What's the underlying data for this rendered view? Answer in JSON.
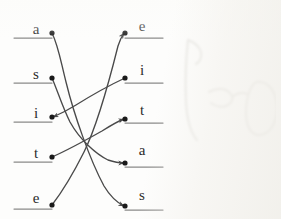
{
  "document": {
    "kind": "hand-drawn-matching-diagram",
    "title": "Letter matching exercise",
    "description": "Two columns of lowercase letters written on ruled answer lines, joined by hand-drawn pencil matching strokes.",
    "ink_color": "#4a4a4a",
    "rule_color": "#8a8a8a",
    "dot_color": "#1a1a1a",
    "paper_color": "#fdfdfc",
    "smudge_color": "#cfcdc7"
  },
  "columns": {
    "left": {
      "name": "left-column",
      "align": "rule-left-of-dot",
      "items": [
        {
          "id": "L1",
          "label": "a",
          "label_x": 36,
          "label_y": 34,
          "dot_x": 52,
          "dot_y": 33,
          "rule_x1": 14,
          "rule_x2": 52,
          "rule_y": 38
        },
        {
          "id": "L2",
          "label": "s",
          "label_x": 36,
          "label_y": 79,
          "dot_x": 52,
          "dot_y": 78,
          "rule_x1": 14,
          "rule_x2": 52,
          "rule_y": 83
        },
        {
          "id": "L3",
          "label": "i",
          "label_x": 36,
          "label_y": 118,
          "dot_x": 52,
          "dot_y": 117,
          "rule_x1": 14,
          "rule_x2": 52,
          "rule_y": 122
        },
        {
          "id": "L4",
          "label": "t",
          "label_x": 36,
          "label_y": 158,
          "dot_x": 52,
          "dot_y": 157,
          "rule_x1": 14,
          "rule_x2": 52,
          "rule_y": 162
        },
        {
          "id": "L5",
          "label": "e",
          "label_x": 36,
          "label_y": 203,
          "dot_x": 52,
          "dot_y": 205,
          "rule_x1": 14,
          "rule_x2": 52,
          "rule_y": 209
        }
      ]
    },
    "right": {
      "name": "right-column",
      "align": "rule-right-of-dot",
      "items": [
        {
          "id": "R1",
          "label": "e",
          "label_x": 142,
          "label_y": 31,
          "dot_x": 125,
          "dot_y": 33,
          "rule_x1": 125,
          "rule_x2": 163,
          "rule_y": 38
        },
        {
          "id": "R2",
          "label": "i",
          "label_x": 142,
          "label_y": 75,
          "dot_x": 125,
          "dot_y": 78,
          "rule_x1": 125,
          "rule_x2": 163,
          "rule_y": 83
        },
        {
          "id": "R3",
          "label": "t",
          "label_x": 142,
          "label_y": 115,
          "dot_x": 125,
          "dot_y": 119,
          "rule_x1": 125,
          "rule_x2": 163,
          "rule_y": 123
        },
        {
          "id": "R4",
          "label": "a",
          "label_x": 142,
          "label_y": 155,
          "dot_x": 125,
          "dot_y": 163,
          "rule_x1": 125,
          "rule_x2": 163,
          "rule_y": 167
        },
        {
          "id": "R5",
          "label": "s",
          "label_x": 142,
          "label_y": 200,
          "dot_x": 125,
          "dot_y": 206,
          "rule_x1": 125,
          "rule_x2": 163,
          "rule_y": 210
        }
      ]
    }
  },
  "connections": [
    {
      "id": "C1",
      "from": "L1",
      "from_label": "a",
      "to": "R5",
      "to_label": "s",
      "arrow_at": "to",
      "path": "M52,33 C58,45 60,58 66,82 C74,115 90,160 104,186 C110,196 118,203 124,206"
    },
    {
      "id": "C2",
      "from": "L2",
      "from_label": "s",
      "to": "R4",
      "to_label": "a",
      "arrow_at": "to",
      "path": "M52,78 C58,92 62,106 70,122 C80,140 96,154 108,160 C114,162 120,163 124,163"
    },
    {
      "id": "C3",
      "from": "R2",
      "from_label": "i",
      "to": "L3",
      "to_label": "i",
      "arrow_at": "to",
      "path": "M125,78 C110,85 92,95 76,105 C68,110 60,114 53,117"
    },
    {
      "id": "C4",
      "from": "L4",
      "from_label": "t",
      "to": "R3",
      "to_label": "t",
      "arrow_at": "to",
      "path": "M52,157 C68,150 86,140 102,131 C110,126 118,121 124,119"
    },
    {
      "id": "C5",
      "from": "L5",
      "from_label": "e",
      "to": "R1",
      "to_label": "e",
      "arrow_at": "to",
      "path": "M52,205 C62,192 72,176 84,152 C98,124 112,70 118,46 C120,40 122,36 124,33"
    }
  ],
  "annotations": {
    "eraser_smudge": {
      "name": "erased-pencil-smudge",
      "note": "faint partly-erased handwriting at right of page",
      "strokes": [
        "M12,4 C10,22 9,44 10,66 C11,84 14,96 21,104",
        "M12,4 C18,6 23,10 25,16 C26,21 24,26 20,28",
        "M33,56 C41,52 49,52 54,57 C58,61 57,66 52,69 C47,72 40,71 35,67",
        "M57,60 C62,57 67,56 71,58",
        "M80,46 C92,44 101,56 101,72 C101,88 93,99 83,99 C75,99 70,90 70,77 C70,62 74,50 80,46"
      ]
    }
  }
}
